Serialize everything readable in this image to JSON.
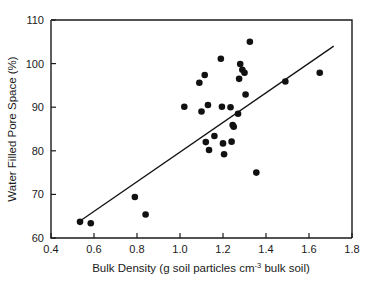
{
  "chart_data": {
    "type": "scatter",
    "title": "",
    "xlabel_parts": {
      "pre": "Bulk Density (g soil particles cm",
      "sup": "-3",
      "post": " bulk soil)"
    },
    "xlabel": "Bulk Density (g soil particles cm-3 bulk soil)",
    "ylabel": "Water Filled Pore Space (%)",
    "xlim": [
      0.4,
      1.8
    ],
    "ylim": [
      60,
      110
    ],
    "xticks": [
      0.4,
      0.6,
      0.8,
      1.0,
      1.2,
      1.4,
      1.6,
      1.8
    ],
    "xtick_labels": [
      "0.4",
      "0.6",
      "0.8",
      "1.0",
      "1.2",
      "1.4",
      "1.6",
      "1.8"
    ],
    "yticks": [
      60,
      70,
      80,
      90,
      100,
      110
    ],
    "ytick_labels": [
      "60",
      "70",
      "80",
      "90",
      "100",
      "110"
    ],
    "grid": false,
    "legend": null,
    "marker": {
      "shape": "circle",
      "color": "#111111",
      "size_px": 3.3
    },
    "points": [
      {
        "x": 0.535,
        "y": 63.7
      },
      {
        "x": 0.585,
        "y": 63.4
      },
      {
        "x": 0.79,
        "y": 69.4
      },
      {
        "x": 0.84,
        "y": 65.4
      },
      {
        "x": 1.02,
        "y": 90.1
      },
      {
        "x": 1.09,
        "y": 95.6
      },
      {
        "x": 1.1,
        "y": 89.0
      },
      {
        "x": 1.115,
        "y": 97.4
      },
      {
        "x": 1.12,
        "y": 82.0
      },
      {
        "x": 1.13,
        "y": 90.5
      },
      {
        "x": 1.135,
        "y": 80.2
      },
      {
        "x": 1.16,
        "y": 83.4
      },
      {
        "x": 1.19,
        "y": 101.1
      },
      {
        "x": 1.195,
        "y": 90.1
      },
      {
        "x": 1.2,
        "y": 81.7
      },
      {
        "x": 1.205,
        "y": 79.2
      },
      {
        "x": 1.235,
        "y": 90.0
      },
      {
        "x": 1.24,
        "y": 82.1
      },
      {
        "x": 1.245,
        "y": 85.9
      },
      {
        "x": 1.25,
        "y": 85.5
      },
      {
        "x": 1.27,
        "y": 88.5
      },
      {
        "x": 1.275,
        "y": 96.5
      },
      {
        "x": 1.28,
        "y": 99.9
      },
      {
        "x": 1.29,
        "y": 98.6
      },
      {
        "x": 1.3,
        "y": 97.9
      },
      {
        "x": 1.305,
        "y": 92.9
      },
      {
        "x": 1.325,
        "y": 105.0
      },
      {
        "x": 1.355,
        "y": 75.0
      },
      {
        "x": 1.49,
        "y": 95.9
      },
      {
        "x": 1.65,
        "y": 97.9
      }
    ],
    "trend_line": {
      "x_start": 0.535,
      "y_start": 63.9,
      "x_end": 1.715,
      "y_end": 104.0
    }
  }
}
